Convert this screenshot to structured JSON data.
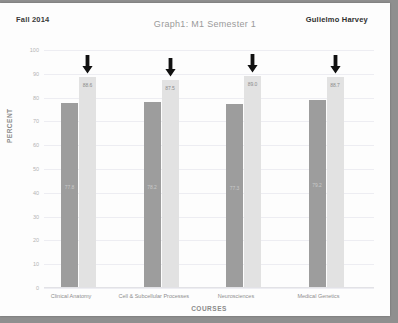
{
  "page": {
    "header_left": "Fall 2014",
    "header_right": "Gulielmo Harvey"
  },
  "chart_data": {
    "type": "bar",
    "title": "Graph1: M1 Semester 1",
    "xlabel": "COURSES",
    "ylabel": "PERCENT",
    "categories": [
      "Clinical Anatomy",
      "Cell & Subcellular Processes",
      "Neurosciences",
      "Medical Genetics"
    ],
    "series": [
      {
        "name": "series-1-dark",
        "color": "#9d9d9d",
        "values": [
          77.8,
          78.2,
          77.3,
          79.2
        ]
      },
      {
        "name": "series-2-light",
        "color": "#e2e2e2",
        "values": [
          88.6,
          87.5,
          89.0,
          88.7
        ]
      }
    ],
    "ylim": [
      0,
      100
    ],
    "yticks": [
      100,
      90,
      80,
      70,
      60,
      50,
      40,
      30,
      20,
      10,
      0
    ],
    "grid": true,
    "legend": "none",
    "annotations": [
      {
        "icon": "down-arrow",
        "target": "series-2-light",
        "category_index": 0
      },
      {
        "icon": "down-arrow",
        "target": "series-2-light",
        "category_index": 1
      },
      {
        "icon": "down-arrow",
        "target": "series-2-light",
        "category_index": 2
      },
      {
        "icon": "down-arrow",
        "target": "series-2-light",
        "category_index": 3
      }
    ]
  }
}
